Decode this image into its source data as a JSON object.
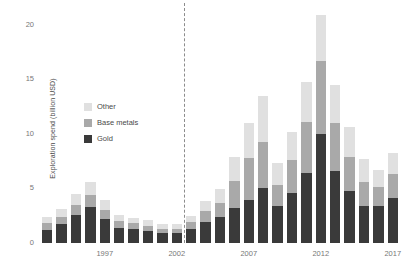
{
  "chart_data": {
    "type": "bar",
    "subtype": "stacked-bar",
    "title": "",
    "xlabel": "",
    "ylabel": "Exploration spend (billion USD)",
    "ylim": [
      0,
      21
    ],
    "yticks": [
      0,
      5,
      10,
      15,
      20
    ],
    "ytick_labels": [
      "0",
      "5",
      "10",
      "15",
      "20"
    ],
    "xticks": [
      1997,
      2002,
      2007,
      2012,
      2017
    ],
    "xtick_labels": [
      "1997",
      "2002",
      "2007",
      "2012",
      "2017"
    ],
    "grid": false,
    "legend_position": "upper left",
    "categories": [
      1993,
      1994,
      1995,
      1996,
      1997,
      1998,
      1999,
      2000,
      2001,
      2002,
      2003,
      2004,
      2005,
      2006,
      2007,
      2008,
      2009,
      2010,
      2011,
      2012,
      2013,
      2014,
      2015,
      2016,
      2017
    ],
    "series": [
      {
        "name": "Gold",
        "color": "#3a3a3a",
        "values": [
          1.2,
          1.7,
          2.6,
          3.3,
          2.2,
          1.4,
          1.3,
          1.1,
          0.9,
          0.9,
          1.3,
          1.9,
          2.4,
          3.2,
          3.9,
          5.0,
          3.4,
          4.6,
          6.4,
          10.0,
          6.6,
          4.8,
          3.4,
          3.4,
          4.1
        ]
      },
      {
        "name": "Base metals",
        "color": "#a9a9a9",
        "values": [
          0.6,
          0.7,
          0.9,
          1.1,
          0.8,
          0.6,
          0.5,
          0.5,
          0.4,
          0.4,
          0.6,
          1.0,
          1.3,
          2.5,
          3.9,
          4.3,
          1.9,
          3.0,
          4.7,
          6.7,
          4.4,
          3.1,
          2.2,
          1.7,
          2.2
        ]
      },
      {
        "name": "Other",
        "color": "#e0e0e0",
        "values": [
          0.6,
          0.7,
          1.0,
          1.2,
          0.9,
          0.6,
          0.5,
          0.5,
          0.4,
          0.4,
          0.6,
          1.0,
          1.3,
          2.2,
          3.2,
          4.2,
          2.0,
          2.6,
          3.7,
          4.2,
          3.5,
          2.7,
          2.1,
          1.6,
          2.0
        ]
      }
    ],
    "annotations": [
      {
        "type": "vline",
        "x": 2003,
        "style": "dashed",
        "color": "#8c8c8c"
      }
    ]
  },
  "legend": {
    "items": [
      {
        "label": "Other",
        "color": "#e0e0e0"
      },
      {
        "label": "Base metals",
        "color": "#a9a9a9"
      },
      {
        "label": "Gold",
        "color": "#3a3a3a"
      }
    ]
  }
}
